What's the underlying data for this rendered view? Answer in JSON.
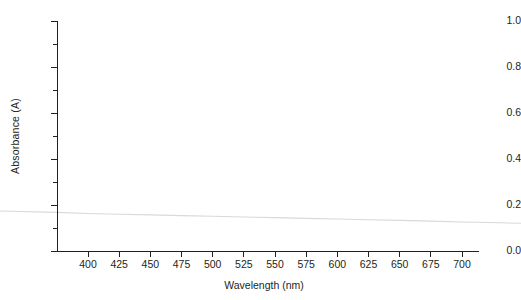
{
  "figure": {
    "background_color": "#ffffff",
    "width": 521,
    "height": 300
  },
  "axes": {
    "spine_color": "#231f20",
    "left_spine_visible": true,
    "bottom_spine_visible": true,
    "top_spine_visible": false,
    "right_spine_visible": false
  },
  "xaxis": {
    "label": "Wavelength (nm)",
    "tick_labels": [
      "400",
      "425",
      "450",
      "475",
      "500",
      "525",
      "550",
      "575",
      "600",
      "625",
      "650",
      "675",
      "700"
    ],
    "tick_values": [
      400,
      425,
      450,
      475,
      500,
      525,
      550,
      575,
      600,
      625,
      650,
      675,
      700
    ],
    "min": 375,
    "max": 712
  },
  "yaxis": {
    "label": "Absorbance (A)",
    "tick_labels": [
      "0.0",
      "0.2",
      "0.4",
      "0.6",
      "0.8",
      "1.0"
    ],
    "tick_values": [
      0.0,
      0.2,
      0.4,
      0.6,
      0.8,
      1.0
    ],
    "minor_tick_values": [
      0.1,
      0.3,
      0.5,
      0.7,
      0.9
    ],
    "min": 0.0,
    "max": 1.0
  },
  "chart_data": {
    "type": "line",
    "title": "",
    "xlabel": "Wavelength (nm)",
    "ylabel": "Absorbance (A)",
    "xlim": [
      375,
      712
    ],
    "ylim": [
      0.0,
      1.0
    ],
    "grid": false,
    "legend": false,
    "line_color": "#d9d9d9",
    "line_width": 1.0,
    "series": [
      {
        "name": "absorbance",
        "x": [
          375,
          400,
          425,
          450,
          475,
          500,
          525,
          550,
          575,
          600,
          625,
          650,
          675,
          700,
          712
        ],
        "values": [
          0.168,
          0.163,
          0.16,
          0.157,
          0.154,
          0.151,
          0.148,
          0.145,
          0.142,
          0.139,
          0.136,
          0.133,
          0.13,
          0.126,
          0.125
        ]
      }
    ]
  }
}
